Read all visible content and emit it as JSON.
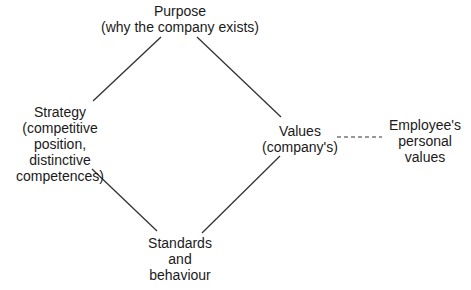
{
  "diagram": {
    "type": "diamond relationship diagram",
    "nodes": {
      "purpose": {
        "lines": [
          "Purpose",
          "(why the company exists)"
        ]
      },
      "strategy": {
        "lines": [
          "Strategy",
          "(competitive",
          "position,",
          "distinctive",
          "competences)"
        ]
      },
      "values": {
        "lines": [
          "Values",
          "(company's)"
        ]
      },
      "standards": {
        "lines": [
          "Standards",
          "and",
          "behaviour"
        ]
      },
      "employee": {
        "lines": [
          "Employee's",
          "personal",
          "values"
        ]
      }
    },
    "edges": [
      {
        "from": "purpose",
        "to": "strategy",
        "style": "solid"
      },
      {
        "from": "purpose",
        "to": "values",
        "style": "solid"
      },
      {
        "from": "strategy",
        "to": "standards",
        "style": "solid"
      },
      {
        "from": "values",
        "to": "standards",
        "style": "solid"
      },
      {
        "from": "values",
        "to": "employee",
        "style": "dashed"
      }
    ],
    "colors": {
      "line": "#333333",
      "text": "#1a1a1a",
      "background": "#ffffff"
    }
  }
}
